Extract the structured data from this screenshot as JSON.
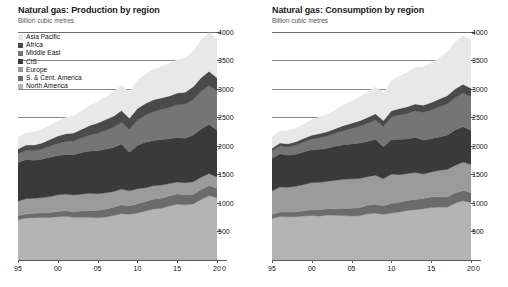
{
  "panels": [
    {
      "id": "production",
      "title": "Natural gas: Production by region",
      "subtitle": "Billion cubic metres"
    },
    {
      "id": "consumption",
      "title": "Natural gas: Consumption by region",
      "subtitle": "Billion cubic metres"
    }
  ],
  "legend": {
    "items": [
      {
        "label": "Asia Pacific",
        "color": "#e8e8e8"
      },
      {
        "label": "Africa",
        "color": "#4a4a4a"
      },
      {
        "label": "Middle East",
        "color": "#757575"
      },
      {
        "label": "CIS",
        "color": "#3a3a3a"
      },
      {
        "label": "Europe",
        "color": "#9b9b9b"
      },
      {
        "label": "S. & Cent. America",
        "color": "#6b6b6b"
      },
      {
        "label": "North America",
        "color": "#b4b4b4"
      }
    ]
  },
  "axis": {
    "y_ticks": [
      500,
      1000,
      1500,
      2000,
      2500,
      3000,
      3500,
      4000
    ],
    "y_min": 0,
    "y_max": 4000,
    "x_ticks": [
      "95",
      "00",
      "05",
      "10",
      "15",
      "20"
    ],
    "x_tick_values": [
      1995,
      2000,
      2005,
      2010,
      2015,
      2020
    ],
    "x_min": 1995,
    "x_max": 2020,
    "zero_label": "0"
  },
  "chart_data": [
    {
      "type": "area",
      "stacked": true,
      "title": "Natural gas: Production by region",
      "subtitle": "Billion cubic metres",
      "xlabel": "",
      "ylabel": "Billion cubic metres",
      "ylim": [
        0,
        4000
      ],
      "xlim": [
        1995,
        2020
      ],
      "grid": true,
      "legend_position": "top-left",
      "x": [
        1995,
        1996,
        1997,
        1998,
        1999,
        2000,
        2001,
        2002,
        2003,
        2004,
        2005,
        2006,
        2007,
        2008,
        2009,
        2010,
        2011,
        2012,
        2013,
        2014,
        2015,
        2016,
        2017,
        2018,
        2019,
        2020
      ],
      "series": [
        {
          "name": "North America",
          "color": "#b4b4b4",
          "values": [
            710,
            735,
            742,
            745,
            746,
            760,
            766,
            748,
            752,
            750,
            740,
            756,
            782,
            812,
            802,
            824,
            860,
            896,
            910,
            948,
            980,
            968,
            982,
            1060,
            1130,
            1090
          ]
        },
        {
          "name": "S. & Cent. America",
          "color": "#6b6b6b",
          "values": [
            68,
            72,
            76,
            80,
            86,
            92,
            96,
            100,
            108,
            118,
            128,
            136,
            144,
            152,
            150,
            160,
            166,
            170,
            172,
            176,
            178,
            174,
            172,
            174,
            176,
            168
          ]
        },
        {
          "name": "Europe",
          "color": "#9b9b9b",
          "values": [
            253,
            268,
            264,
            270,
            280,
            292,
            294,
            292,
            296,
            302,
            296,
            288,
            276,
            282,
            262,
            268,
            242,
            238,
            234,
            216,
            212,
            214,
            218,
            216,
            212,
            200
          ]
        },
        {
          "name": "CIS",
          "color": "#3a3a3a",
          "values": [
            680,
            690,
            666,
            672,
            690,
            690,
            694,
            708,
            730,
            742,
            754,
            766,
            770,
            788,
            678,
            758,
            796,
            792,
            800,
            788,
            780,
            782,
            820,
            850,
            862,
            820
          ]
        },
        {
          "name": "Middle East",
          "color": "#757575",
          "values": [
            150,
            160,
            170,
            180,
            196,
            212,
            228,
            240,
            258,
            280,
            306,
            332,
            356,
            382,
            398,
            444,
            480,
            504,
            528,
            548,
            572,
            596,
            624,
            660,
            686,
            688
          ]
        },
        {
          "name": "Africa",
          "color": "#4a4a4a",
          "values": [
            86,
            92,
            98,
            106,
            114,
            128,
            136,
            142,
            150,
            168,
            178,
            186,
            196,
            206,
            196,
            204,
            202,
            210,
            200,
            200,
            206,
            210,
            224,
            238,
            244,
            232
          ]
        },
        {
          "name": "Asia Pacific",
          "color": "#e8e8e8",
          "values": [
            200,
            214,
            228,
            236,
            248,
            266,
            284,
            300,
            320,
            346,
            368,
            396,
            422,
            444,
            452,
            490,
            512,
            532,
            552,
            570,
            582,
            594,
            624,
            656,
            678,
            670
          ]
        }
      ]
    },
    {
      "type": "area",
      "stacked": true,
      "title": "Natural gas: Consumption by region",
      "subtitle": "Billion cubic metres",
      "xlabel": "",
      "ylabel": "Billion cubic metres",
      "ylim": [
        0,
        4000
      ],
      "xlim": [
        1995,
        2020
      ],
      "grid": true,
      "legend_position": "none",
      "x": [
        1995,
        1996,
        1997,
        1998,
        1999,
        2000,
        2001,
        2002,
        2003,
        2004,
        2005,
        2006,
        2007,
        2008,
        2009,
        2010,
        2011,
        2012,
        2013,
        2014,
        2015,
        2016,
        2017,
        2018,
        2019,
        2020
      ],
      "series": [
        {
          "name": "North America",
          "color": "#b4b4b4",
          "values": [
            728,
            762,
            758,
            760,
            772,
            782,
            772,
            790,
            784,
            780,
            772,
            776,
            812,
            820,
            800,
            826,
            842,
            870,
            882,
            898,
            920,
            928,
            924,
            1000,
            1040,
            1010
          ]
        },
        {
          "name": "S. & Cent. America",
          "color": "#6b6b6b",
          "values": [
            72,
            78,
            82,
            86,
            92,
            98,
            104,
            108,
            114,
            124,
            134,
            142,
            150,
            156,
            152,
            164,
            170,
            176,
            180,
            182,
            184,
            180,
            180,
            182,
            180,
            172
          ]
        },
        {
          "name": "Europe",
          "color": "#9b9b9b",
          "values": [
            412,
            442,
            436,
            450,
            462,
            478,
            486,
            484,
            502,
            514,
            518,
            514,
            500,
            512,
            474,
            520,
            488,
            470,
            472,
            430,
            442,
            466,
            482,
            478,
            498,
            492
          ]
        },
        {
          "name": "CIS",
          "color": "#3a3a3a",
          "values": [
            570,
            580,
            560,
            560,
            572,
            576,
            580,
            582,
            596,
            606,
            612,
            620,
            618,
            630,
            560,
            606,
            620,
            608,
            618,
            596,
            580,
            586,
            604,
            620,
            622,
            600
          ]
        },
        {
          "name": "Middle East",
          "color": "#757575",
          "values": [
            134,
            142,
            152,
            162,
            176,
            190,
            204,
            214,
            230,
            250,
            272,
            294,
            318,
            340,
            356,
            392,
            424,
            446,
            466,
            486,
            506,
            528,
            548,
            572,
            590,
            592
          ]
        },
        {
          "name": "Africa",
          "color": "#4a4a4a",
          "values": [
            44,
            48,
            52,
            56,
            60,
            66,
            72,
            76,
            80,
            86,
            92,
            96,
            102,
            106,
            104,
            110,
            112,
            118,
            120,
            124,
            130,
            136,
            144,
            150,
            154,
            148
          ]
        },
        {
          "name": "Asia Pacific",
          "color": "#e8e8e8",
          "values": [
            196,
            212,
            226,
            236,
            250,
            270,
            290,
            308,
            330,
            360,
            386,
            416,
            446,
            472,
            486,
            530,
            568,
            600,
            640,
            672,
            690,
            716,
            770,
            818,
            846,
            842
          ]
        }
      ]
    }
  ]
}
